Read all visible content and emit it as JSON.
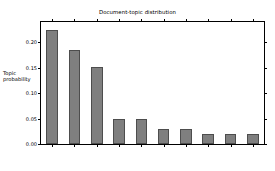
{
  "chart_data": {
    "type": "bar",
    "title": "Document-topic distribution",
    "xlabel": "",
    "ylabel": "Topic\nprobability",
    "categories": [
      "Automobile",
      "Artificial\nintelligence",
      "Internet",
      "Traffic",
      "Computer\nidentification",
      "Map",
      "Map\ninformation",
      "Academy",
      "Location",
      "Travel"
    ],
    "values": [
      0.225,
      0.185,
      0.151,
      0.05,
      0.05,
      0.03,
      0.03,
      0.02,
      0.02,
      0.02
    ],
    "ylim": [
      0.0,
      0.24
    ],
    "yticks": [
      0.0,
      0.05,
      0.1,
      0.15,
      0.2
    ],
    "ytick_labels": [
      "0.00",
      "0.05",
      "0.10",
      "0.15",
      "0.20"
    ],
    "grid": false,
    "legend": null,
    "bar_color": "#7f7f7f",
    "bar_edge_color": "#4d4d4d",
    "background_color": "#ffffff",
    "axis_color": "#000000"
  }
}
